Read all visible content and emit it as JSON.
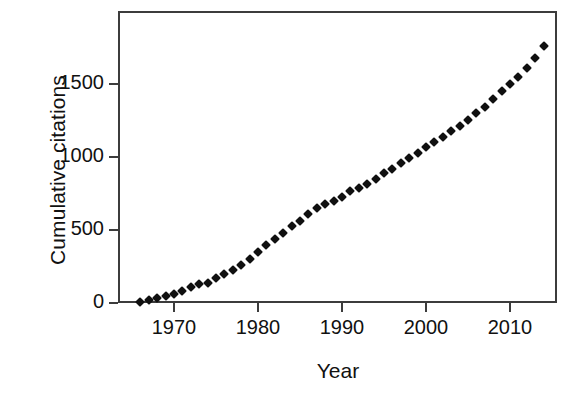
{
  "chart_data": {
    "type": "scatter",
    "title": "",
    "xlabel": "Year",
    "ylabel": "Cumulative citations",
    "xlim": [
      1964.4,
      1966.0
    ],
    "x_axis_range": [
      1964.4,
      2016.6
    ],
    "ylim": [
      0,
      1900
    ],
    "grid": false,
    "legend": null,
    "marker": "diamond",
    "marker_color": "#101010",
    "xticks": [
      1970,
      1980,
      1990,
      2000,
      2010
    ],
    "xtick_labels": [
      "1970",
      "1980",
      "1990",
      "2000",
      "2010"
    ],
    "yticks": [
      0,
      500,
      1000,
      1500
    ],
    "ytick_labels": [
      "0",
      "500",
      "1000",
      "1500"
    ],
    "x": [
      1966,
      1967,
      1968,
      1969,
      1970,
      1971,
      1972,
      1973,
      1974,
      1975,
      1976,
      1977,
      1978,
      1979,
      1980,
      1981,
      1982,
      1983,
      1984,
      1985,
      1986,
      1987,
      1988,
      1989,
      1990,
      1991,
      1992,
      1993,
      1994,
      1995,
      1996,
      1997,
      1998,
      1999,
      2000,
      2001,
      2002,
      2003,
      2004,
      2005,
      2006,
      2007,
      2008,
      2009,
      2010,
      2011,
      2012,
      2013,
      2014
    ],
    "y": [
      5,
      18,
      32,
      45,
      62,
      80,
      110,
      128,
      140,
      170,
      200,
      225,
      263,
      300,
      348,
      395,
      437,
      478,
      530,
      565,
      613,
      648,
      675,
      700,
      723,
      765,
      790,
      818,
      850,
      888,
      920,
      958,
      992,
      1030,
      1068,
      1100,
      1138,
      1175,
      1212,
      1255,
      1300,
      1345,
      1395,
      1450,
      1500,
      1550,
      1610,
      1680,
      1760
    ],
    "series": [
      {
        "name": "Cumulative citations",
        "values": [
          5,
          18,
          32,
          45,
          62,
          80,
          110,
          128,
          140,
          170,
          200,
          225,
          263,
          300,
          348,
          395,
          437,
          478,
          530,
          565,
          613,
          648,
          675,
          700,
          723,
          765,
          790,
          818,
          850,
          888,
          920,
          958,
          992,
          1030,
          1068,
          1100,
          1138,
          1175,
          1212,
          1255,
          1300,
          1345,
          1395,
          1450,
          1500,
          1550,
          1610,
          1680,
          1760
        ]
      }
    ]
  },
  "figure": {
    "axis_color": "#3c3c3c",
    "background": "#ffffff"
  }
}
